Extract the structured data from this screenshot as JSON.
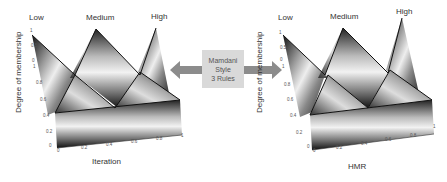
{
  "center": {
    "lines": [
      "Mamdani",
      "Style",
      "3 Rules"
    ],
    "box_color": "#d9d9d9",
    "arrow_color": "#8c8c8c"
  },
  "left_plot": {
    "set_labels": [
      "Low",
      "Medium",
      "High"
    ],
    "ylabel": "Degree of membership",
    "xlabel": "Iteration",
    "z_ticks_back": [
      "1",
      "0.5",
      "0"
    ],
    "z_ticks": [
      "1",
      "0.8",
      "0.6",
      "0.4",
      "0.2",
      "0"
    ],
    "x_ticks": [
      "0",
      "0.2",
      "0.4",
      "0.6",
      "0.8",
      "1"
    ]
  },
  "right_plot": {
    "set_labels": [
      "Low",
      "Medium",
      "High"
    ],
    "ylabel": "Degree of membership",
    "xlabel": "HMR",
    "z_ticks_back": [
      "1",
      "0.5",
      "0"
    ],
    "z_ticks": [
      "1",
      "0.8",
      "0.6",
      "0.4",
      "0.2",
      "0"
    ],
    "x_ticks": [
      "0",
      "0.2",
      "0.4",
      "0.6",
      "0.8",
      "1"
    ]
  }
}
